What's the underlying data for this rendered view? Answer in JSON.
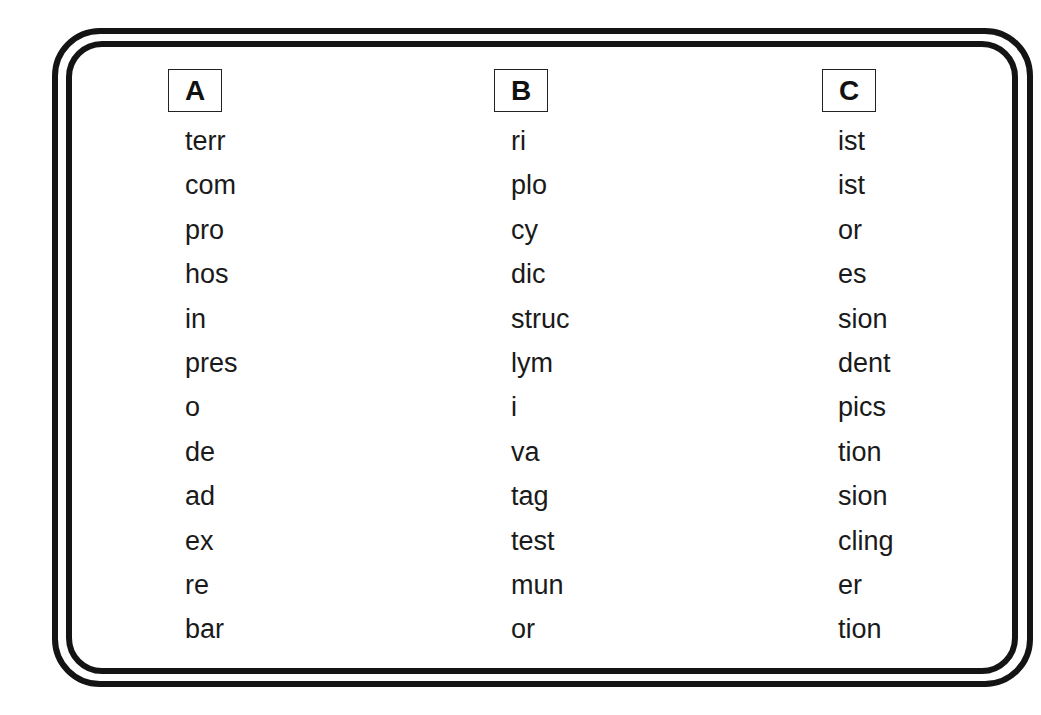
{
  "columns": [
    {
      "header": "A",
      "items": [
        "terr",
        "com",
        "pro",
        "hos",
        "in",
        "pres",
        "o",
        "de",
        "ad",
        "ex",
        "re",
        "bar"
      ]
    },
    {
      "header": "B",
      "items": [
        "ri",
        "plo",
        "cy",
        "dic",
        "struc",
        "lym",
        "i",
        "va",
        "tag",
        "test",
        "mun",
        "or"
      ]
    },
    {
      "header": "C",
      "items": [
        "ist",
        "ist",
        "or",
        "es",
        "sion",
        "dent",
        "pics",
        "tion",
        "sion",
        "cling",
        "er",
        "tion"
      ]
    }
  ]
}
